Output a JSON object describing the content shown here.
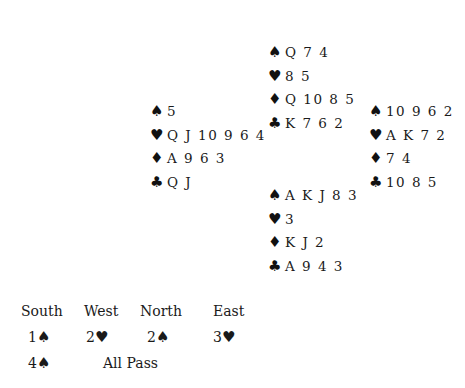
{
  "deal": {
    "north": {
      "spades": "Q 7 4",
      "hearts": "8 5",
      "diamonds": "Q 10 8 5",
      "clubs": "K 7 6 2"
    },
    "west": {
      "spades": "5",
      "hearts": "Q J 10 9 6 4",
      "diamonds": "A 9 6 3",
      "clubs": "Q J"
    },
    "east": {
      "spades": "10 9 6 2",
      "hearts": "A K 7 2",
      "diamonds": "7 4",
      "clubs": "10 8 5"
    },
    "south": {
      "spades": "A K J 8 3",
      "hearts": "3",
      "diamonds": "K J 2",
      "clubs": "A 9 4 3"
    }
  },
  "suit_symbols": {
    "spades": "♠",
    "hearts": "♥",
    "diamonds": "♦",
    "clubs": "♣"
  },
  "auction": {
    "headers": [
      "South",
      "West",
      "North",
      "East"
    ],
    "rounds": [
      [
        {
          "level": "1",
          "suit": "♠"
        },
        {
          "level": "2",
          "suit": "♥"
        },
        {
          "level": "2",
          "suit": "♠"
        },
        {
          "level": "3",
          "suit": "♥"
        }
      ],
      [
        {
          "level": "4",
          "suit": "♠"
        },
        {
          "text": "All Pass"
        }
      ]
    ]
  }
}
